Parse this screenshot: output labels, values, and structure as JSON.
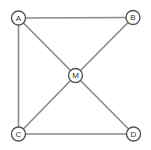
{
  "diagram": {
    "type": "graph",
    "nodes": [
      {
        "id": "A",
        "label": "A",
        "x": 18.5,
        "y": 18
      },
      {
        "id": "B",
        "label": "B",
        "x": 133,
        "y": 17.5
      },
      {
        "id": "M",
        "label": "M",
        "x": 75.5,
        "y": 75.5
      },
      {
        "id": "C",
        "label": "C",
        "x": 18.5,
        "y": 134
      },
      {
        "id": "D",
        "label": "D",
        "x": 133.5,
        "y": 134
      }
    ],
    "edges": [
      {
        "from": "A",
        "to": "B"
      },
      {
        "from": "A",
        "to": "C"
      },
      {
        "from": "A",
        "to": "M"
      },
      {
        "from": "B",
        "to": "M"
      },
      {
        "from": "C",
        "to": "M"
      },
      {
        "from": "D",
        "to": "M"
      },
      {
        "from": "C",
        "to": "D"
      }
    ],
    "colors": {
      "edge": "#8a8a8a",
      "node_stroke": "#555555",
      "node_fill": "#ffffff",
      "text": "#333333"
    }
  }
}
